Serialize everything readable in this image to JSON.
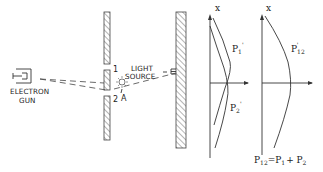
{
  "figure": {
    "electron_gun": {
      "label_line1": "ELECTRON",
      "label_line2": "GUN"
    },
    "light_source": {
      "label_line1": "LIGHT",
      "label_line2": "SOURCE"
    },
    "slits": {
      "slit1_label": "1",
      "slit2_label": "2"
    },
    "point_a_label": "A",
    "graph1": {
      "axis_label": "x",
      "curve1_label": "P",
      "curve1_sub": "1",
      "curve1_prime": "'",
      "curve2_label": "P",
      "curve2_sub": "2",
      "curve2_prime": "'"
    },
    "graph2": {
      "axis_label": "x",
      "curve_label": "P",
      "curve_sub": "12",
      "curve_prime": "'"
    },
    "equation": {
      "lhs": "P",
      "lhs_sub": "12",
      "eq": "=P",
      "t1_sub": "1",
      "plus": "+ P",
      "t2_sub": "2",
      "prime": "'"
    },
    "colors": {
      "ink": "#333333",
      "background": "#ffffff"
    }
  }
}
